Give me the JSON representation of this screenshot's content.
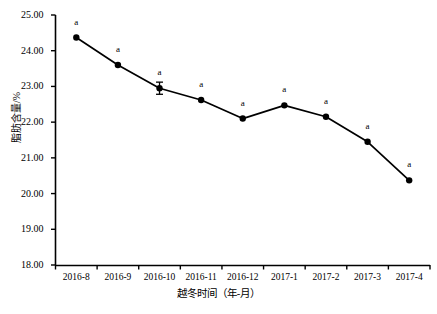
{
  "chart_data": {
    "type": "line",
    "title": "",
    "xlabel": "越冬时间（年-月）",
    "ylabel": "脂肪含量/%",
    "categories": [
      "2016-8",
      "2016-9",
      "2016-10",
      "2016-11",
      "2016-12",
      "2017-1",
      "2017-2",
      "2017-3",
      "2017-4"
    ],
    "values": [
      24.37,
      23.6,
      22.95,
      22.62,
      22.1,
      22.47,
      22.15,
      21.45,
      20.37
    ],
    "errors": [
      0.0,
      0.0,
      0.17,
      0.0,
      0.0,
      0.0,
      0.0,
      0.0,
      0.0
    ],
    "point_labels": [
      "a",
      "a",
      "a",
      "a",
      "a",
      "a",
      "a",
      "a",
      "a"
    ],
    "ylim": [
      18.0,
      25.0
    ],
    "ytick_labels": [
      "25.00",
      "24.00",
      "23.00",
      "22.00",
      "21.00",
      "20.00",
      "19.00",
      "18.00"
    ],
    "ytick_values": [
      25.0,
      24.0,
      23.0,
      22.0,
      21.0,
      20.0,
      19.0,
      18.0
    ],
    "grid": false,
    "legend": "none",
    "marker": "filled-circle",
    "line_color": "#000000",
    "marker_color": "#000000",
    "axis_color": "#000000"
  }
}
